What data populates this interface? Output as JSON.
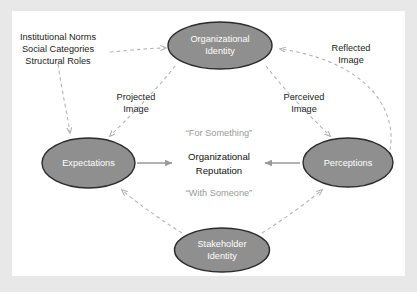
{
  "figure": {
    "type": "conceptual-diagram",
    "background_color": "#ffffff",
    "frame_color": "#e8e8e8",
    "node_fill_color": "#8f8f8f",
    "node_stroke_color": "#2b2b2b",
    "node_text_color": "#ffffff",
    "dashed_edge_color": "#b3b3b3",
    "solid_edge_color": "#9a9a9a",
    "quote_text_color": "#9a9a9a"
  },
  "nodes": [
    {
      "id": "organizational-identity",
      "label_line1": "Organizational",
      "label_line2": "Identity"
    },
    {
      "id": "expectations",
      "label_line1": "Expectations",
      "label_line2": ""
    },
    {
      "id": "perceptions",
      "label_line1": "Perceptions",
      "label_line2": ""
    },
    {
      "id": "stakeholder-identity",
      "label_line1": "Stakeholder",
      "label_line2": "Identity"
    }
  ],
  "center": {
    "top_quote": "“For Something”",
    "title_line1": "Organizational",
    "title_line2": "Reputation",
    "bottom_quote": "“With Someone”"
  },
  "antecedents": {
    "line1": "Institutional Norms",
    "line2": "Social Categories",
    "line3": "Structural Roles"
  },
  "edge_labels": {
    "projected_image_line1": "Projected",
    "projected_image_line2": "Image",
    "perceived_image_line1": "Perceived",
    "perceived_image_line2": "Image",
    "reflected_image_line1": "Reflected",
    "reflected_image_line2": "Image"
  }
}
